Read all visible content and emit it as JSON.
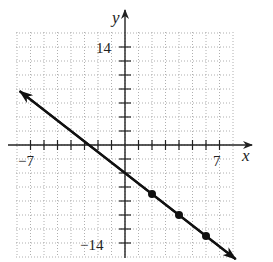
{
  "chart_data": {
    "type": "line",
    "title": "",
    "xlabel": "x",
    "ylabel": "y",
    "xlim": [
      -8,
      9
    ],
    "ylim": [
      -16,
      16
    ],
    "x_ticks": [
      -7,
      -6,
      -5,
      -4,
      -3,
      -2,
      -1,
      0,
      1,
      2,
      3,
      4,
      5,
      6,
      7
    ],
    "y_ticks": [
      -14,
      -12,
      -10,
      -8,
      -6,
      -4,
      -2,
      0,
      2,
      4,
      6,
      8,
      10,
      12,
      14
    ],
    "tick_labels": {
      "x_left": "−7",
      "x_right": "7",
      "y_top": "14",
      "y_bottom": "−14"
    },
    "grid": true,
    "series": [
      {
        "name": "line",
        "equation": "y = -3/2 x - 4",
        "slope": -1.5,
        "intercept": -4,
        "endpoints_arrowed": true,
        "x_range": [
          -7.8,
          8.2
        ],
        "marked_points": [
          {
            "x": 2,
            "y": -7
          },
          {
            "x": 4,
            "y": -10
          },
          {
            "x": 6,
            "y": -13
          }
        ]
      }
    ],
    "legend": null
  },
  "colors": {
    "line": "#111111",
    "axis": "#222222",
    "grid": "#9a9a9a"
  }
}
